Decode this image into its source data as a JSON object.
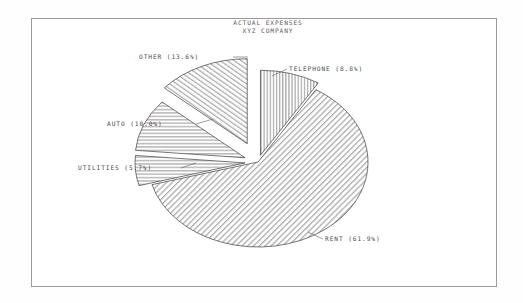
{
  "window": {
    "background_color": "#ffffff",
    "frame_color": "#9a9a9a"
  },
  "chart_data": {
    "type": "pie",
    "title": "ACTUAL EXPENSES",
    "subtitle": "XYZ COMPANY",
    "xlabel": "",
    "ylabel": "",
    "grid": false,
    "legend_position": "none",
    "label_format": "NAME (P%)",
    "categories": [
      "TELEPHONE",
      "RENT",
      "UTILITIES",
      "AUTO",
      "OTHER"
    ],
    "values": [
      8.8,
      61.9,
      5.7,
      10.0,
      13.6
    ],
    "labels": [
      "TELEPHONE (8.8%)",
      "RENT (61.9%)",
      "UTILITIES (5.7%)",
      "AUTO (10.0%)",
      "OTHER (13.6%)"
    ],
    "slices": [
      {
        "name": "TELEPHONE",
        "value": 8.8,
        "label": "TELEPHONE (8.8%)",
        "hatch": "vertical",
        "exploded": true,
        "start_angle_deg": 0.0,
        "end_angle_deg": 31.68
      },
      {
        "name": "RENT",
        "value": 61.9,
        "label": "RENT (61.9%)",
        "hatch": "diagonal-right",
        "exploded": false,
        "start_angle_deg": 31.68,
        "end_angle_deg": 254.52
      },
      {
        "name": "UTILITIES",
        "value": 5.7,
        "label": "UTILITIES (5.7%)",
        "hatch": "horizontal",
        "exploded": true,
        "start_angle_deg": 254.52,
        "end_angle_deg": 275.04
      },
      {
        "name": "AUTO",
        "value": 10.0,
        "label": "AUTO (10.0%)",
        "hatch": "horizontal",
        "exploded": true,
        "start_angle_deg": 275.04,
        "end_angle_deg": 311.04
      },
      {
        "name": "OTHER",
        "value": 13.6,
        "label": "OTHER (13.6%)",
        "hatch": "diagonal-left",
        "exploded": true,
        "start_angle_deg": 311.04,
        "end_angle_deg": 360.0
      }
    ]
  }
}
